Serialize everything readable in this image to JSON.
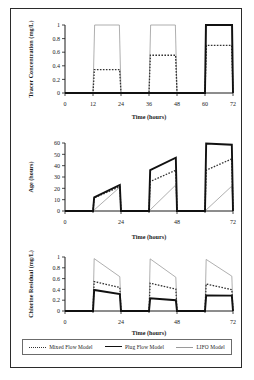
{
  "figure": {
    "legend": {
      "items": [
        {
          "label": "Mixed Flow Model",
          "style": "dotted",
          "color": "#333333"
        },
        {
          "label": "Plug Flow Model",
          "style": "thick-solid",
          "color": "#111111"
        },
        {
          "label": "LIFO Model",
          "style": "thin-solid",
          "color": "#9a9a9a"
        }
      ]
    }
  },
  "chart_data": [
    {
      "type": "line",
      "panel": "tracer",
      "title": "",
      "xlabel": "Time (hours)",
      "ylabel": "Tracer Concentration (mg/L)",
      "xlim": [
        0,
        72
      ],
      "ylim": [
        0,
        1
      ],
      "xticks": [
        0,
        12,
        24,
        36,
        48,
        60,
        72
      ],
      "yticks": [
        0,
        0.2,
        0.4,
        0.6,
        0.8,
        1
      ],
      "grid": false,
      "legend_position": "bottom-shared",
      "series": [
        {
          "name": "Mixed Flow Model",
          "points": [
            [
              0,
              0
            ],
            [
              12,
              0
            ],
            [
              12.6,
              0.345
            ],
            [
              23.4,
              0.345
            ],
            [
              24,
              0
            ],
            [
              36,
              0
            ],
            [
              36.6,
              0.555
            ],
            [
              47.4,
              0.555
            ],
            [
              48,
              0
            ],
            [
              60,
              0
            ],
            [
              60.6,
              0.7
            ],
            [
              71.4,
              0.7
            ],
            [
              72,
              0
            ]
          ]
        },
        {
          "name": "Plug Flow Model",
          "points": [
            [
              0,
              0
            ],
            [
              60,
              0
            ],
            [
              60.4,
              1.0
            ],
            [
              71.6,
              1.0
            ],
            [
              72,
              0
            ]
          ]
        },
        {
          "name": "LIFO Model",
          "points": [
            [
              0,
              0
            ],
            [
              12,
              0
            ],
            [
              12.7,
              1.0
            ],
            [
              23.3,
              1.0
            ],
            [
              24,
              0
            ],
            [
              36,
              0
            ],
            [
              36.7,
              1.0
            ],
            [
              47.3,
              1.0
            ],
            [
              48,
              0
            ],
            [
              60,
              0
            ],
            [
              60.7,
              1.0
            ],
            [
              71.3,
              1.0
            ],
            [
              72,
              0
            ]
          ]
        }
      ]
    },
    {
      "type": "line",
      "panel": "age",
      "title": "",
      "xlabel": "Time (hours)",
      "ylabel": "Age (hours)",
      "xlim": [
        0,
        72
      ],
      "ylim": [
        0,
        60
      ],
      "xticks": [
        0,
        24,
        48,
        72
      ],
      "yticks": [
        0,
        10,
        20,
        30,
        40,
        50,
        60
      ],
      "grid": false,
      "legend_position": "bottom-shared",
      "series": [
        {
          "name": "Mixed Flow Model",
          "points": [
            [
              0,
              0
            ],
            [
              12,
              0
            ],
            [
              12.5,
              11.5
            ],
            [
              23.5,
              21.5
            ],
            [
              24,
              0
            ],
            [
              36,
              0
            ],
            [
              36.5,
              26
            ],
            [
              47.5,
              36
            ],
            [
              48,
              0
            ],
            [
              60,
              0
            ],
            [
              60.5,
              36
            ],
            [
              71.5,
              46
            ],
            [
              72,
              0
            ]
          ]
        },
        {
          "name": "Plug Flow Model",
          "points": [
            [
              0,
              0
            ],
            [
              12,
              0
            ],
            [
              12.5,
              12
            ],
            [
              23.5,
              23
            ],
            [
              24,
              0
            ],
            [
              36,
              0
            ],
            [
              36.5,
              36
            ],
            [
              47.5,
              47
            ],
            [
              48,
              0
            ],
            [
              60,
              0
            ],
            [
              60.5,
              59.5
            ],
            [
              71.5,
              58.5
            ],
            [
              72,
              0
            ]
          ]
        },
        {
          "name": "LIFO Model",
          "points": [
            [
              0,
              0
            ],
            [
              12,
              0
            ],
            [
              23.5,
              21
            ],
            [
              24,
              0
            ],
            [
              36,
              0
            ],
            [
              47.5,
              23
            ],
            [
              48,
              0
            ],
            [
              60,
              0
            ],
            [
              71.5,
              22
            ],
            [
              72,
              0
            ]
          ]
        }
      ]
    },
    {
      "type": "line",
      "panel": "chlorine",
      "title": "",
      "xlabel": "Time (hours)",
      "ylabel": "Chlorine Residual (mg/L)",
      "xlim": [
        0,
        72
      ],
      "ylim": [
        0,
        1
      ],
      "xticks": [
        0,
        24,
        48,
        72
      ],
      "yticks": [
        0,
        0.2,
        0.4,
        0.6,
        0.8,
        1
      ],
      "grid": false,
      "legend_position": "bottom-shared",
      "series": [
        {
          "name": "Mixed Flow Model",
          "points": [
            [
              0,
              0
            ],
            [
              12,
              0
            ],
            [
              12.5,
              0.545
            ],
            [
              23.5,
              0.435
            ],
            [
              24,
              0
            ],
            [
              36,
              0
            ],
            [
              36.5,
              0.515
            ],
            [
              47.5,
              0.405
            ],
            [
              48,
              0
            ],
            [
              60,
              0
            ],
            [
              60.5,
              0.5
            ],
            [
              71.5,
              0.395
            ],
            [
              72,
              0
            ]
          ]
        },
        {
          "name": "Plug Flow Model",
          "points": [
            [
              0,
              0
            ],
            [
              12,
              0
            ],
            [
              12.5,
              0.39
            ],
            [
              23.5,
              0.315
            ],
            [
              24,
              0
            ],
            [
              36,
              0
            ],
            [
              36.5,
              0.235
            ],
            [
              47.5,
              0.2
            ],
            [
              48,
              0
            ],
            [
              60,
              0
            ],
            [
              60.5,
              0.29
            ],
            [
              71.5,
              0.285
            ],
            [
              72,
              0
            ]
          ]
        },
        {
          "name": "LIFO Model",
          "points": [
            [
              0,
              0
            ],
            [
              12,
              0
            ],
            [
              12.5,
              0.97
            ],
            [
              23.5,
              0.635
            ],
            [
              24,
              0
            ],
            [
              36,
              0
            ],
            [
              36.5,
              0.965
            ],
            [
              47.5,
              0.625
            ],
            [
              48,
              0
            ],
            [
              60,
              0
            ],
            [
              60.5,
              0.955
            ],
            [
              71.5,
              0.645
            ],
            [
              72,
              0
            ]
          ]
        }
      ]
    }
  ]
}
